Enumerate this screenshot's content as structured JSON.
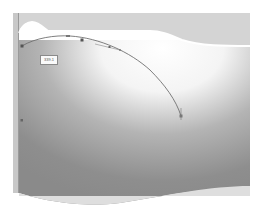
{
  "canvas": {
    "title": "Path editing canvas",
    "label_box": {
      "text": "339.1"
    },
    "colors": {
      "background": "#ffffff",
      "top_band": "#d3d3d3",
      "gradient_dark": "#8c8c8c",
      "bottom_band": "#dcdcdc",
      "left_ruler": "#c4c4c4",
      "path_stroke": "#6e6e6e",
      "anchor": "#555555"
    },
    "anchors": [
      {
        "x": 22,
        "y": 46
      },
      {
        "x": 68,
        "y": 36
      },
      {
        "x": 82,
        "y": 40
      },
      {
        "x": 110,
        "y": 47
      },
      {
        "x": 181,
        "y": 116
      }
    ]
  }
}
